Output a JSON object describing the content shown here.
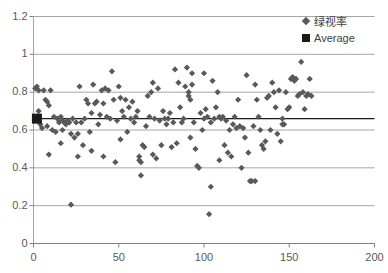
{
  "chart_data": {
    "type": "scatter",
    "title": "",
    "xlabel": "",
    "ylabel": "",
    "xlim": [
      0,
      200
    ],
    "ylim": [
      0,
      1.2
    ],
    "grid": true,
    "grid_axis": "y",
    "legend_position": "top-right",
    "x_ticks": [
      "0",
      "50",
      "100",
      "150",
      "200"
    ],
    "x_tick_values": [
      0,
      50,
      100,
      150,
      200
    ],
    "y_ticks": [
      "0",
      "0.2",
      "0.4",
      "0.6",
      "0.8",
      "1",
      "1.2"
    ],
    "y_tick_values": [
      0,
      0.2,
      0.4,
      0.6,
      0.8,
      1,
      1.2
    ],
    "marker_color": "#595959",
    "average_color": "#1a1a1a",
    "average_value": 0.66,
    "series": [
      {
        "name": "绿视率",
        "marker": "diamond",
        "color": "#595959",
        "points": [
          [
            1,
            0.82
          ],
          [
            2,
            0.83
          ],
          [
            2,
            0.67
          ],
          [
            3,
            0.81
          ],
          [
            3,
            0.7
          ],
          [
            4,
            0.63
          ],
          [
            5,
            0.61
          ],
          [
            6,
            0.81
          ],
          [
            7,
            0.76
          ],
          [
            8,
            0.75
          ],
          [
            8,
            0.62
          ],
          [
            9,
            0.73
          ],
          [
            9,
            0.47
          ],
          [
            10,
            0.81
          ],
          [
            11,
            0.6
          ],
          [
            12,
            0.67
          ],
          [
            13,
            0.59
          ],
          [
            14,
            0.66
          ],
          [
            15,
            0.64
          ],
          [
            16,
            0.67
          ],
          [
            16,
            0.53
          ],
          [
            17,
            0.65
          ],
          [
            17,
            0.6
          ],
          [
            18,
            0.64
          ],
          [
            19,
            0.63
          ],
          [
            20,
            0.65
          ],
          [
            21,
            0.64
          ],
          [
            22,
            0.205
          ],
          [
            22,
            0.58
          ],
          [
            23,
            0.66
          ],
          [
            24,
            0.56
          ],
          [
            25,
            0.64
          ],
          [
            26,
            0.58
          ],
          [
            26,
            0.46
          ],
          [
            27,
            0.83
          ],
          [
            28,
            0.64
          ],
          [
            29,
            0.52
          ],
          [
            30,
            0.66
          ],
          [
            31,
            0.76
          ],
          [
            32,
            0.74
          ],
          [
            33,
            0.59
          ],
          [
            34,
            0.69
          ],
          [
            34,
            0.49
          ],
          [
            35,
            0.84
          ],
          [
            36,
            0.74
          ],
          [
            37,
            0.75
          ],
          [
            38,
            0.63
          ],
          [
            39,
            0.68
          ],
          [
            40,
            0.81
          ],
          [
            41,
            0.74
          ],
          [
            41,
            0.46
          ],
          [
            42,
            0.82
          ],
          [
            43,
            0.67
          ],
          [
            44,
            0.81
          ],
          [
            45,
            0.66
          ],
          [
            46,
            0.91
          ],
          [
            47,
            0.76
          ],
          [
            48,
            0.43
          ],
          [
            49,
            0.65
          ],
          [
            50,
            0.83
          ],
          [
            51,
            0.77
          ],
          [
            51,
            0.55
          ],
          [
            52,
            0.7
          ],
          [
            53,
            0.67
          ],
          [
            54,
            0.76
          ],
          [
            55,
            0.59
          ],
          [
            56,
            0.72
          ],
          [
            57,
            0.66
          ],
          [
            58,
            0.75
          ],
          [
            59,
            0.64
          ],
          [
            60,
            0.67
          ],
          [
            61,
            0.7
          ],
          [
            62,
            0.44
          ],
          [
            62,
            0.46
          ],
          [
            63,
            0.36
          ],
          [
            63,
            0.43
          ],
          [
            64,
            0.52
          ],
          [
            65,
            0.51
          ],
          [
            66,
            0.62
          ],
          [
            67,
            0.78
          ],
          [
            68,
            0.67
          ],
          [
            69,
            0.8
          ],
          [
            70,
            0.85
          ],
          [
            70,
            0.47
          ],
          [
            71,
            0.66
          ],
          [
            72,
            0.45
          ],
          [
            73,
            0.82
          ],
          [
            74,
            0.65
          ],
          [
            75,
            0.52
          ],
          [
            76,
            0.7
          ],
          [
            77,
            0.66
          ],
          [
            78,
            0.63
          ],
          [
            79,
            0.66
          ],
          [
            80,
            0.69
          ],
          [
            81,
            0.51
          ],
          [
            82,
            0.64
          ],
          [
            83,
            0.92
          ],
          [
            84,
            0.53
          ],
          [
            85,
            0.85
          ],
          [
            86,
            0.72
          ],
          [
            87,
            0.64
          ],
          [
            88,
            0.66
          ],
          [
            89,
            0.83
          ],
          [
            90,
            0.93
          ],
          [
            91,
            0.78
          ],
          [
            91,
            0.8
          ],
          [
            92,
            0.76
          ],
          [
            92,
            0.56
          ],
          [
            93,
            0.9
          ],
          [
            93,
            0.84
          ],
          [
            94,
            0.64
          ],
          [
            95,
            0.5
          ],
          [
            96,
            0.41
          ],
          [
            97,
            0.4
          ],
          [
            98,
            0.69
          ],
          [
            99,
            0.6
          ],
          [
            100,
            0.9
          ],
          [
            100,
            0.66
          ],
          [
            101,
            0.71
          ],
          [
            102,
            0.67
          ],
          [
            103,
            0.155
          ],
          [
            104,
            0.3
          ],
          [
            104,
            0.64
          ],
          [
            105,
            0.86
          ],
          [
            106,
            0.66
          ],
          [
            107,
            0.72
          ],
          [
            108,
            0.8
          ],
          [
            109,
            0.67
          ],
          [
            109,
            0.44
          ],
          [
            110,
            0.66
          ],
          [
            111,
            0.67
          ],
          [
            112,
            0.52
          ],
          [
            113,
            0.65
          ],
          [
            114,
            0.48
          ],
          [
            115,
            0.6
          ],
          [
            116,
            0.46
          ],
          [
            117,
            0.63
          ],
          [
            118,
            0.67
          ],
          [
            119,
            0.61
          ],
          [
            120,
            0.76
          ],
          [
            121,
            0.62
          ],
          [
            122,
            0.4
          ],
          [
            123,
            0.61
          ],
          [
            124,
            0.56
          ],
          [
            125,
            0.89
          ],
          [
            126,
            0.48
          ],
          [
            127,
            0.33
          ],
          [
            128,
            0.33
          ],
          [
            129,
            0.62
          ],
          [
            130,
            0.84
          ],
          [
            130,
            0.33
          ],
          [
            131,
            0.76
          ],
          [
            132,
            0.67
          ],
          [
            133,
            0.6
          ],
          [
            134,
            0.52
          ],
          [
            135,
            0.5
          ],
          [
            136,
            0.54
          ],
          [
            137,
            0.77
          ],
          [
            138,
            0.78
          ],
          [
            139,
            0.6
          ],
          [
            140,
            0.85
          ],
          [
            141,
            0.8
          ],
          [
            142,
            0.72
          ],
          [
            143,
            0.58
          ],
          [
            144,
            0.81
          ],
          [
            145,
            0.54
          ],
          [
            146,
            0.66
          ],
          [
            146,
            0.63
          ],
          [
            147,
            0.63
          ],
          [
            148,
            0.8
          ],
          [
            149,
            0.71
          ],
          [
            150,
            0.72
          ],
          [
            151,
            0.87
          ],
          [
            152,
            0.88
          ],
          [
            153,
            0.86
          ],
          [
            154,
            0.87
          ],
          [
            155,
            0.78
          ],
          [
            156,
            0.79
          ],
          [
            157,
            0.96
          ],
          [
            158,
            0.8
          ],
          [
            159,
            0.71
          ],
          [
            160,
            0.78
          ],
          [
            161,
            0.79
          ],
          [
            162,
            0.87
          ],
          [
            163,
            0.78
          ]
        ]
      },
      {
        "name": "Average",
        "marker": "square",
        "color": "#1a1a1a",
        "points": [
          [
            2,
            0.66
          ]
        ]
      }
    ]
  },
  "legend": {
    "items": [
      {
        "label": "绿视率",
        "marker": "diamond"
      },
      {
        "label": "Average",
        "marker": "square"
      }
    ]
  }
}
